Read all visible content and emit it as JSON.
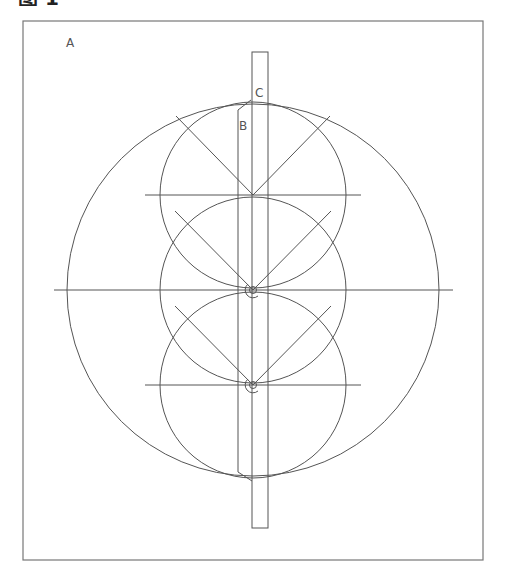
{
  "figure": {
    "caption": "图 1",
    "labels": {
      "a": "A",
      "b": "B",
      "c": "C"
    },
    "colors": {
      "line": "#555555",
      "frame": "#777777",
      "background": "#ffffff"
    }
  },
  "geometry": {
    "frame": {
      "x": 23,
      "y": 21,
      "w": 460,
      "h": 539
    },
    "outer_circle": {
      "cx": 253,
      "cy": 290,
      "r": 186
    },
    "small_circles": [
      {
        "cx": 253,
        "cy": 195,
        "r": 93
      },
      {
        "cx": 253,
        "cy": 290,
        "r": 93
      },
      {
        "cx": 253,
        "cy": 385,
        "r": 93
      }
    ],
    "horizontal_lines": [
      {
        "y": 195,
        "x1": 145,
        "x2": 361
      },
      {
        "y": 290,
        "x1": 54,
        "x2": 453
      },
      {
        "y": 385,
        "x1": 145,
        "x2": 361
      }
    ],
    "bar": {
      "x": 252,
      "y": 52,
      "w": 16,
      "h": 476
    }
  }
}
